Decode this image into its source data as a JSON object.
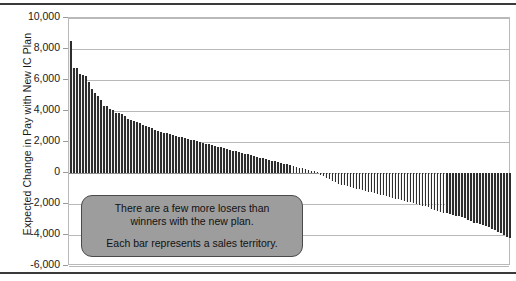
{
  "chart_data": {
    "type": "bar",
    "title": "",
    "subtitle": "",
    "xlabel": "",
    "ylabel": "Expected Change in Pay with New IC Plan",
    "ylim": [
      -6000,
      10000
    ],
    "ytick_labels": [
      "10,000",
      "8,000",
      "6,000",
      "4,000",
      "2,000",
      "0",
      "-2,000",
      "-4,000",
      "-6,000"
    ],
    "ytick_values": [
      10000,
      8000,
      6000,
      4000,
      2000,
      0,
      -2000,
      -4000,
      -6000
    ],
    "grid": true,
    "legend": "none",
    "xtick_labels": [],
    "bar_color": "#2d2d2d",
    "categories_note": "Each bar is one sales territory, sorted descending",
    "values": [
      8500,
      6800,
      6750,
      6400,
      6350,
      6250,
      5900,
      5400,
      5150,
      4950,
      4700,
      4350,
      4300,
      4150,
      4050,
      3900,
      3850,
      3800,
      3700,
      3500,
      3400,
      3350,
      3300,
      3250,
      3100,
      3050,
      2950,
      2900,
      2800,
      2700,
      2650,
      2600,
      2550,
      2500,
      2450,
      2400,
      2350,
      2300,
      2250,
      2200,
      2150,
      2100,
      2050,
      2000,
      1950,
      1900,
      1850,
      1800,
      1750,
      1700,
      1650,
      1600,
      1550,
      1500,
      1450,
      1400,
      1350,
      1300,
      1250,
      1200,
      1150,
      1100,
      1050,
      1000,
      950,
      900,
      850,
      800,
      750,
      700,
      650,
      600,
      550,
      500,
      450,
      400,
      350,
      300,
      250,
      200,
      150,
      100,
      50,
      -100,
      -200,
      -300,
      -400,
      -500,
      -600,
      -700,
      -750,
      -800,
      -850,
      -900,
      -950,
      -1000,
      -1050,
      -1100,
      -1150,
      -1200,
      -1250,
      -1300,
      -1350,
      -1400,
      -1450,
      -1500,
      -1550,
      -1600,
      -1650,
      -1700,
      -1750,
      -1800,
      -1850,
      -1900,
      -1950,
      -2000,
      -2050,
      -2100,
      -2150,
      -2200,
      -2300,
      -2400,
      -2450,
      -2500,
      -2550,
      -2600,
      -2650,
      -2700,
      -2750,
      -2800,
      -2850,
      -2900,
      -3000,
      -3100,
      -3200,
      -3250,
      -3300,
      -3350,
      -3400,
      -3500,
      -3600,
      -3700,
      -3800,
      -3900,
      -4000,
      -4100,
      -4200
    ]
  },
  "annotation": {
    "line1": "There are a few more losers than",
    "line2": "winners with the new plan.",
    "line3": "Each bar represents a sales territory."
  }
}
